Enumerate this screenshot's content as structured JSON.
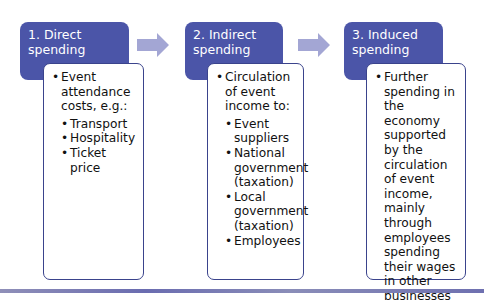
{
  "diagram": {
    "type": "flow",
    "colors": {
      "header_fill": "#4b55a8",
      "body_border": "#3a438c",
      "arrow_fill": "#a3a6d4",
      "header_text": "#ffffff"
    },
    "stages": [
      {
        "title_line1": "1. Direct",
        "title_line2": "spending",
        "bullet": "Event attendance costs, e.g.:",
        "sub_bullets": [
          "Transport",
          "Hospitality",
          "Ticket price"
        ]
      },
      {
        "title_line1": "2. Indirect",
        "title_line2": "spending",
        "bullet": "Circulation of event income to:",
        "sub_bullets": [
          "Event suppliers",
          "National government (taxation)",
          "Local government (taxation)",
          "Employees"
        ]
      },
      {
        "title_line1": "3. Induced",
        "title_line2": "spending",
        "bullet": "Further spending in the economy supported by the circulation of event income, mainly through employees spending their wages in other businesses",
        "sub_bullets": []
      }
    ],
    "arrows": [
      {
        "from": "1. Direct spending",
        "to": "2. Indirect spending",
        "icon": "right-arrow-icon"
      },
      {
        "from": "2. Indirect spending",
        "to": "3. Induced spending",
        "icon": "right-arrow-icon"
      }
    ]
  }
}
